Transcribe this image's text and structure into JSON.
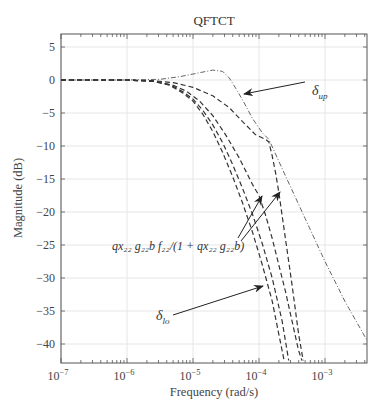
{
  "chart_data": {
    "type": "line",
    "title": "QFTCT",
    "xlabel": "Frequency (rad/s)",
    "ylabel": "Magnitude (dB)",
    "xscale": "log",
    "xlim": [
      1e-07,
      0.0044
    ],
    "ylim": [
      -42.5,
      7
    ],
    "grid": true,
    "legend": "none",
    "x_ticks": [
      {
        "exp": -7,
        "label": "10",
        "sup": "−7"
      },
      {
        "exp": -6,
        "label": "10",
        "sup": "−6"
      },
      {
        "exp": -5,
        "label": "10",
        "sup": "−5"
      },
      {
        "exp": -4,
        "label": "10",
        "sup": "−4"
      },
      {
        "exp": -3,
        "label": "10",
        "sup": "−3"
      }
    ],
    "y_ticks": [
      5,
      0,
      -5,
      -10,
      -15,
      -20,
      -25,
      -30,
      -35,
      -40
    ],
    "y_tick_labels": [
      "5",
      "0",
      "−5",
      "−10",
      "−15",
      "−20",
      "−25",
      "−30",
      "−35",
      "−40"
    ],
    "series": [
      {
        "name": "delta_up",
        "style": "dashdot",
        "log10_x": [
          -7,
          -6,
          -5.5,
          -5.2,
          -4.9,
          -4.7,
          -4.55,
          -4.45,
          -4.35,
          -4.25,
          -4.1,
          -3.95,
          -3.85,
          -3.6,
          -3.3,
          -3.0,
          -2.7,
          -2.36
        ],
        "y": [
          0,
          0,
          0.1,
          0.5,
          1.1,
          1.5,
          1.3,
          0.3,
          -1.3,
          -3.0,
          -5.8,
          -8.0,
          -9.0,
          -14.5,
          -21.0,
          -27.5,
          -33.5,
          -39.5
        ]
      },
      {
        "name": "qx22_g22b_f22_over_1_plus_qx22_g22b_upper",
        "style": "dashed",
        "log10_x": [
          -7,
          -6,
          -5.6,
          -5.3,
          -5.0,
          -4.7,
          -4.45,
          -4.25,
          -4.05,
          -3.9,
          -3.85,
          -3.8,
          -3.75,
          -3.7,
          -3.6,
          -3.5,
          -3.4,
          -3.33
        ],
        "y": [
          0,
          0,
          -0.1,
          -0.4,
          -1.1,
          -2.4,
          -4.2,
          -6.3,
          -8.3,
          -9.0,
          -9.4,
          -11.5,
          -14.0,
          -17.0,
          -24.0,
          -31.0,
          -38.5,
          -42.5
        ]
      },
      {
        "name": "qx22_g22b_f22_over_1_plus_qx22_g22b_lower",
        "style": "dashed",
        "log10_x": [
          -7,
          -6,
          -5.6,
          -5.3,
          -5.1,
          -4.9,
          -4.7,
          -4.5,
          -4.3,
          -4.1,
          -4.0,
          -3.9,
          -3.8,
          -3.7,
          -3.6,
          -3.5,
          -3.4,
          -3.35
        ],
        "y": [
          0,
          0,
          -0.2,
          -0.8,
          -1.7,
          -3.2,
          -5.4,
          -8.4,
          -11.8,
          -15.8,
          -17.5,
          -20.5,
          -24.0,
          -28.0,
          -32.0,
          -36.5,
          -41.0,
          -42.5
        ]
      },
      {
        "name": "delta_lo",
        "style": "dashed",
        "log10_x": [
          -7,
          -6,
          -5.6,
          -5.35,
          -5.15,
          -5.0,
          -4.85,
          -4.7,
          -4.55,
          -4.4,
          -4.25,
          -4.1,
          -3.95,
          -3.8,
          -3.7,
          -3.62
        ],
        "y": [
          0,
          0,
          -0.2,
          -0.8,
          -2.0,
          -3.2,
          -5.2,
          -7.8,
          -11.0,
          -14.6,
          -18.6,
          -23.0,
          -28.0,
          -33.5,
          -38.5,
          -42.5
        ]
      },
      {
        "name": "inner_steep",
        "style": "dashed",
        "log10_x": [
          -7,
          -6,
          -5.6,
          -5.35,
          -5.15,
          -5.0,
          -4.85,
          -4.7,
          -4.55,
          -4.4,
          -4.25,
          -4.1,
          -3.95,
          -3.8,
          -3.65,
          -3.55
        ],
        "y": [
          0,
          0,
          -0.2,
          -0.7,
          -1.8,
          -2.9,
          -4.6,
          -6.8,
          -9.5,
          -12.8,
          -16.4,
          -20.3,
          -24.8,
          -30.0,
          -36.5,
          -42.5
        ]
      }
    ],
    "annotations": [
      {
        "id": "delta_up",
        "text": "δ",
        "sub": "up",
        "text_x_px": 312,
        "text_y_px": 95,
        "arrow_from": [
          305,
          82
        ],
        "arrow_to": [
          244,
          94
        ]
      },
      {
        "id": "transfer_fn",
        "text": "qx₂₂ g₂₂b f₂₂/(1 + qx₂₂ g₂₂b)",
        "text_x_px": 112,
        "text_y_px": 250,
        "arrows": [
          {
            "from": [
              238,
              238
            ],
            "to": [
              262,
              196
            ]
          },
          {
            "from": [
              241,
              241
            ],
            "to": [
              280,
              192
            ]
          }
        ]
      },
      {
        "id": "delta_lo",
        "text": "δ",
        "sub": "lo",
        "text_x_px": 156,
        "text_y_px": 320,
        "arrow_from": [
          173,
          315
        ],
        "arrow_to": [
          263,
          286
        ]
      }
    ]
  }
}
